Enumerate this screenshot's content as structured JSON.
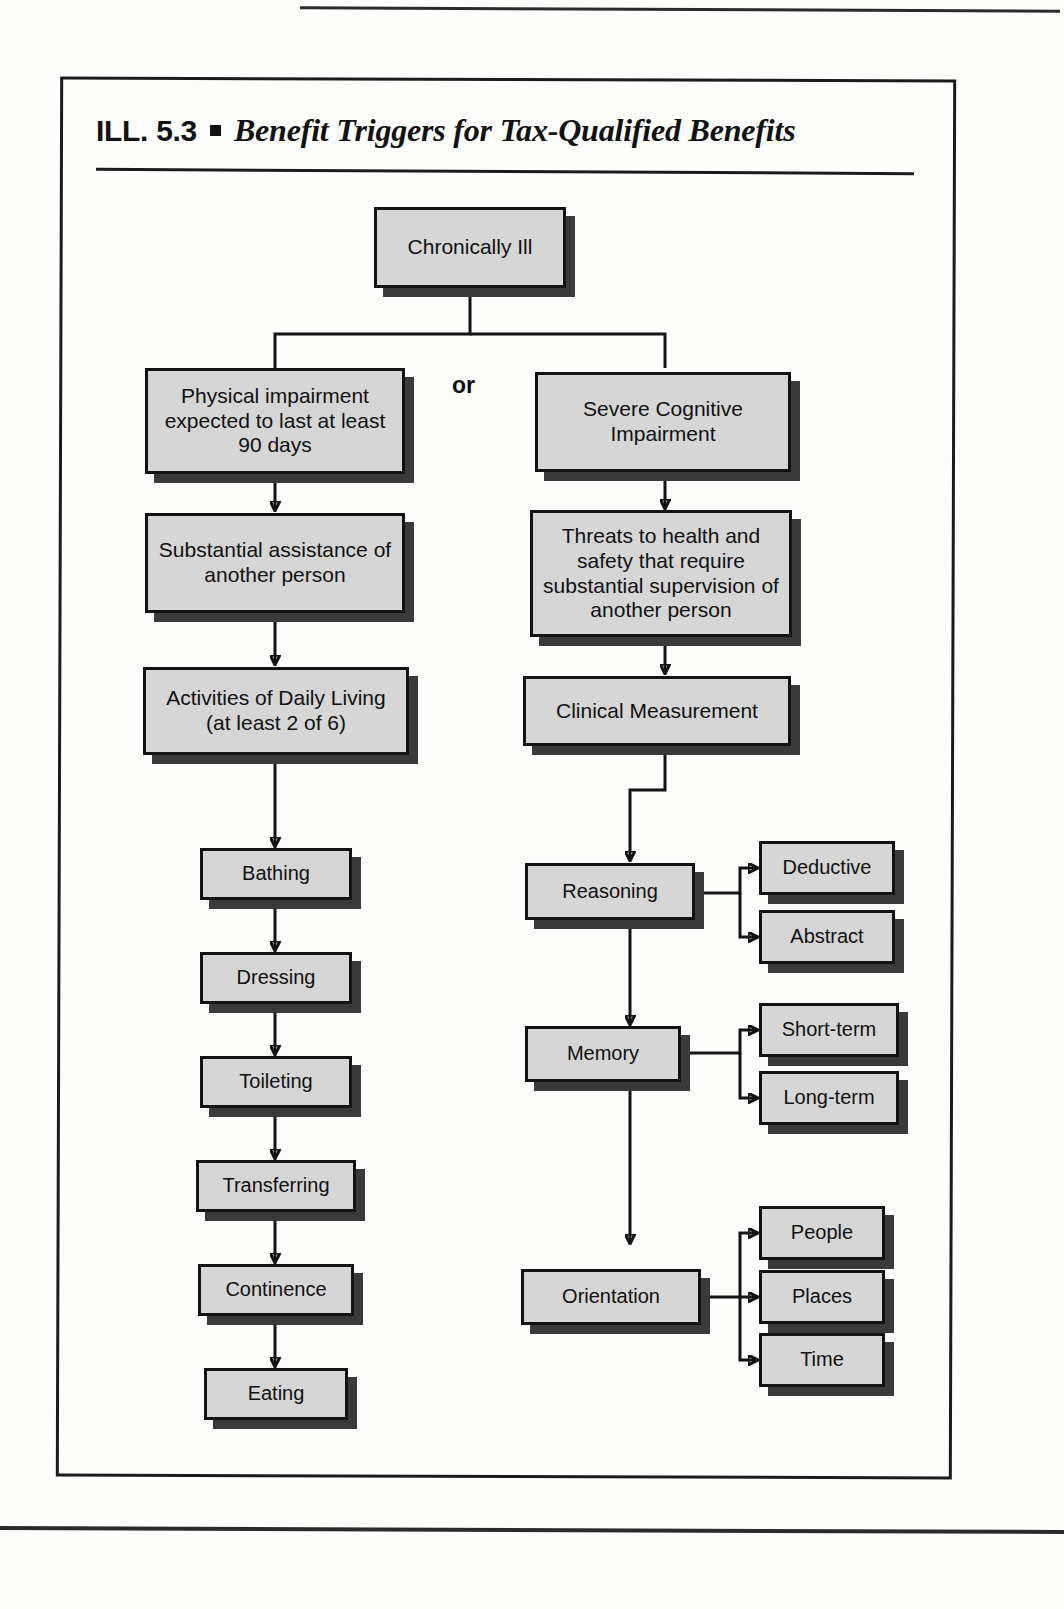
{
  "page": {
    "top_rule": "page-header-rule",
    "bottom_rule": "page-footer-rule"
  },
  "title": {
    "label": "ILL. 5.3",
    "bullet": "square-bullet",
    "text": "Benefit Triggers for Tax-Qualified Benefits"
  },
  "diagram": {
    "or_label": "or",
    "nodes": {
      "root": "Chronically Ill",
      "physical_impairment": "Physical impairment expected to last at least 90 days",
      "substantial_assistance": "Substantial assistance of another person",
      "adl": "Activities of Daily Living (at least 2 of 6)",
      "bathing": "Bathing",
      "dressing": "Dressing",
      "toileting": "Toileting",
      "transferring": "Transferring",
      "continence": "Continence",
      "eating": "Eating",
      "severe_cognitive": "Severe Cognitive Impairment",
      "threats": "Threats to health and safety that require substantial supervision of another person",
      "clinical_measurement": "Clinical Measurement",
      "reasoning": "Reasoning",
      "deductive": "Deductive",
      "abstract": "Abstract",
      "memory": "Memory",
      "short_term": "Short-term",
      "long_term": "Long-term",
      "orientation": "Orientation",
      "people": "People",
      "places": "Places",
      "time": "Time"
    }
  },
  "colors": {
    "node_fill": "#d6d6d6",
    "node_border": "#131313",
    "node_shadow": "#3a3a3a",
    "page_background": "#fdfdfb",
    "ink": "#101010"
  }
}
